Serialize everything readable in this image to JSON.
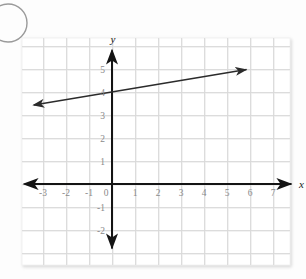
{
  "figure": {
    "background_color": "#fdfdfd",
    "panel": {
      "x": 22,
      "y": 38,
      "width": 268,
      "height": 227,
      "fill": "#ffffff",
      "grid_color": "#d8d8d8",
      "grid_minor_color": "#ececec",
      "shadow_color": "#e8e8e8"
    },
    "decoration": {
      "corner_circle": {
        "name": "corner-circle-outline",
        "cx": 8,
        "cy": 23,
        "r": 19,
        "stroke": "#9a9a9a",
        "stroke_width": 1.4
      }
    },
    "axis_color": "#141414",
    "line_color": "#2b2b2b"
  },
  "chart_data": {
    "type": "line",
    "title": "",
    "xlabel": "x",
    "ylabel": "y",
    "grid": true,
    "legend": null,
    "xlim": [
      -3.8,
      7.8
    ],
    "ylim": [
      -2.8,
      5.8
    ],
    "x_ticks": [
      -3,
      -2,
      -1,
      0,
      1,
      2,
      3,
      4,
      5,
      6,
      7
    ],
    "x_tick_labels": [
      "-3",
      "-2",
      "-1",
      "0",
      "1",
      "2",
      "3",
      "4",
      "5",
      "6",
      "7"
    ],
    "y_ticks": [
      -2,
      -1,
      1,
      2,
      3,
      4,
      5
    ],
    "y_tick_labels": [
      "-2",
      "-1",
      "1",
      "2",
      "3",
      "4",
      "5"
    ],
    "origin_label": "0",
    "series": [
      {
        "name": "line",
        "kind": "infinite-line",
        "slope": 0.1667,
        "intercept": 4,
        "equation": "y = (1/6)x + 4",
        "arrow_start": true,
        "arrow_end": true,
        "x_start": -3.4,
        "x_end": 5.85,
        "points": [
          {
            "x": -3.4,
            "y": 3.43
          },
          {
            "x": 0,
            "y": 4
          },
          {
            "x": 5.85,
            "y": 4.98
          }
        ]
      }
    ],
    "axes": {
      "x_axis": {
        "arrow_start": true,
        "arrow_end": true,
        "label": "x"
      },
      "y_axis": {
        "arrow_start": true,
        "arrow_end": true,
        "label": "y"
      }
    }
  }
}
